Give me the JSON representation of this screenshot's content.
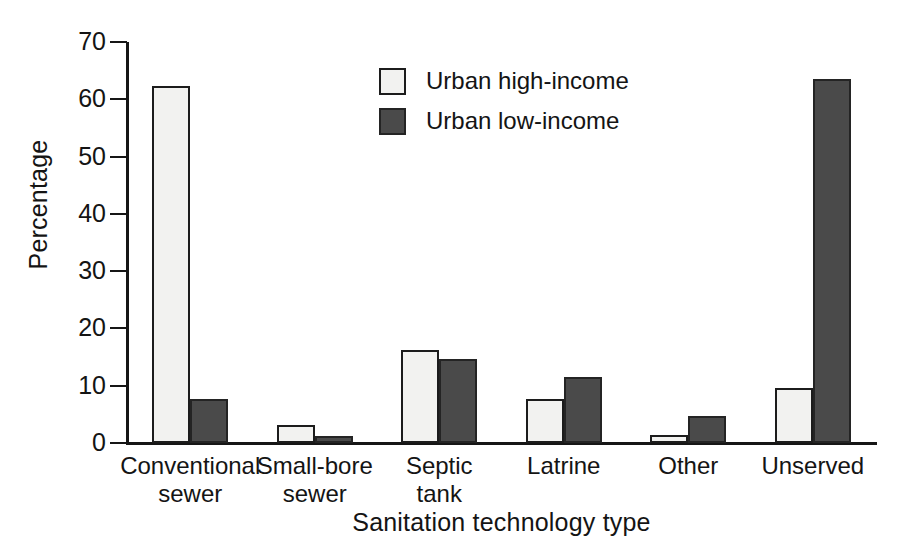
{
  "chart_data": {
    "type": "bar",
    "title": "",
    "xlabel": "Sanitation technology type",
    "ylabel": "Percentage",
    "ylim": [
      0,
      70
    ],
    "yticks": [
      0,
      10,
      20,
      30,
      40,
      50,
      60,
      70
    ],
    "grid": false,
    "legend_position": "top-center",
    "categories": [
      "Conventional sewer",
      "Small-bore sewer",
      "Septic tank",
      "Latrine",
      "Other",
      "Unserved"
    ],
    "category_lines": [
      [
        "Conventional",
        "sewer"
      ],
      [
        "Small-bore",
        "sewer"
      ],
      [
        "Septic",
        "tank"
      ],
      [
        "Latrine"
      ],
      [
        "Other"
      ],
      [
        "Unserved"
      ]
    ],
    "series": [
      {
        "name": "Urban high-income",
        "color": "#f2f2f0",
        "values": [
          62.3,
          3.2,
          16.3,
          7.7,
          1.4,
          9.6
        ]
      },
      {
        "name": "Urban low-income",
        "color": "#4a4a4a",
        "values": [
          7.6,
          1.2,
          14.6,
          11.6,
          4.8,
          63.5
        ]
      }
    ]
  },
  "legend": {
    "items": [
      {
        "label": "Urban high-income",
        "swatch": "light-swatch"
      },
      {
        "label": "Urban low-income",
        "swatch": "dark-swatch"
      }
    ]
  },
  "axes": {
    "y_title": "Percentage",
    "x_title": "Sanitation technology type",
    "y_tick_labels": [
      "0",
      "10",
      "20",
      "30",
      "40",
      "50",
      "60",
      "70"
    ]
  },
  "colors": {
    "series_high": "#f2f2f0",
    "series_low": "#4a4a4a",
    "axis": "#161616",
    "text": "#141414",
    "background": "#ffffff"
  }
}
